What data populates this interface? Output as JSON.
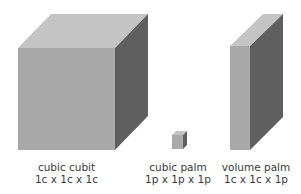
{
  "colors": {
    "front": "#a9a9a9",
    "top": "#c4c4c4",
    "side": "#5f5f5f",
    "text": "#3a3a3a"
  },
  "items": [
    {
      "name": "cubic cubit",
      "dims": "1c x 1c x 1c"
    },
    {
      "name": "cubic palm",
      "dims": "1p x 1p x 1p"
    },
    {
      "name": "volume palm",
      "dims": "1c x 1c x 1p"
    }
  ]
}
